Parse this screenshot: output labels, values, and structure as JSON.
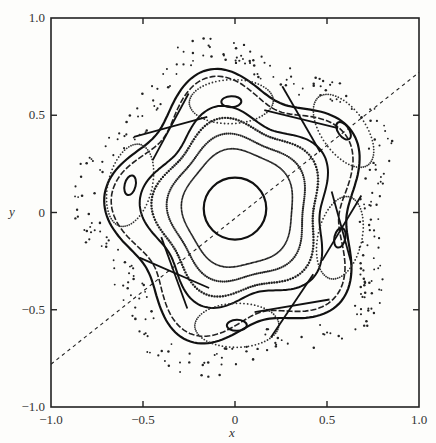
{
  "chart_data": {
    "type": "scatter",
    "title": "",
    "xlabel": "x",
    "ylabel": "y",
    "xlim": [
      -1.0,
      1.0
    ],
    "ylim": [
      -1.0,
      1.0
    ],
    "grid": false,
    "legend": null,
    "x_ticks": [
      {
        "value": -1.0,
        "label": "−1.0"
      },
      {
        "value": -0.5,
        "label": "−0.5"
      },
      {
        "value": 0,
        "label": "0"
      },
      {
        "value": 0.5,
        "label": "0.5"
      },
      {
        "value": 1.0,
        "label": "1.0"
      }
    ],
    "y_ticks": [
      {
        "value": -1.0,
        "label": "−1.0"
      },
      {
        "value": -0.5,
        "label": "−0.5"
      },
      {
        "value": 0,
        "label": "0"
      },
      {
        "value": 0.5,
        "label": "0.5"
      },
      {
        "value": 1.0,
        "label": "1.0"
      }
    ],
    "symmetry_line": {
      "style": "dashed",
      "from": [
        -1.0,
        -0.78
      ],
      "to": [
        1.0,
        0.72
      ]
    },
    "central_curve": {
      "style": "solid",
      "center": [
        0.0,
        0.02
      ],
      "rx": 0.17,
      "ry": 0.16
    },
    "nested_tori": [
      {
        "style": "dotted",
        "scale": 0.36
      },
      {
        "style": "dotted",
        "scale": 0.44
      }
    ],
    "island_centers": [
      {
        "x": -0.57,
        "y": 0.14
      },
      {
        "x": -0.02,
        "y": 0.57
      },
      {
        "x": 0.59,
        "y": 0.42
      },
      {
        "x": 0.57,
        "y": -0.13
      },
      {
        "x": 0.01,
        "y": -0.58
      }
    ],
    "hyperbolic_points": [
      {
        "x": -0.35,
        "y": 0.44
      },
      {
        "x": 0.36,
        "y": 0.48
      },
      {
        "x": 0.58,
        "y": -0.08
      },
      {
        "x": 0.31,
        "y": -0.48
      },
      {
        "x": -0.33,
        "y": -0.31
      }
    ],
    "chaotic_region": {
      "style": "scattered-dots",
      "r_min": 0.66,
      "r_max": 0.92
    }
  }
}
